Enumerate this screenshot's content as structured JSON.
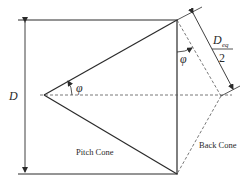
{
  "diagram": {
    "labels": {
      "diameter": "D",
      "angle_left": "φ",
      "angle_right": "φ",
      "deq_numerator": "D",
      "deq_subscript": "eq",
      "deq_denominator": "2",
      "pitch_cone": "Pitch Cone",
      "back_cone": "Back Cone"
    },
    "colors": {
      "line": "#2a2a2a",
      "dashed": "#555555",
      "background": "#ffffff"
    }
  }
}
